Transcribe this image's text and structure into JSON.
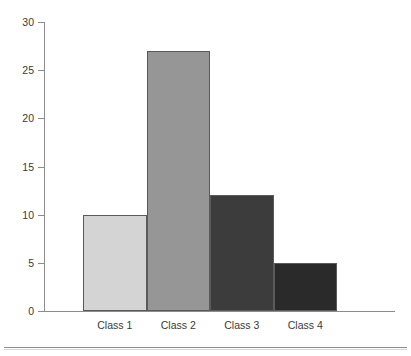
{
  "chart_data": {
    "type": "bar",
    "title": "",
    "subtitle": "",
    "xlabel": "",
    "ylabel": "",
    "categories": [
      "Class 1",
      "Class 2",
      "Class 3",
      "Class 4"
    ],
    "values": [
      10,
      27,
      12,
      5
    ],
    "ylim": [
      0,
      30
    ],
    "ytick_values": [
      0,
      5,
      10,
      15,
      20,
      25,
      30
    ],
    "ytick_labels": [
      "0",
      "5",
      "10",
      "15",
      "20",
      "25",
      "30"
    ],
    "ytick_step": 5,
    "grid": false,
    "legend": null,
    "legend_position": "none",
    "bar_gap": 0,
    "annotations": [],
    "bar_colors": [
      "#d4d4d4",
      "#969696",
      "#3c3c3c",
      "#2a2a2a"
    ],
    "bar_border_color": "#5a5a5a",
    "axis_color": "#8c8c8c",
    "tick_label_color": "#3a3a3a",
    "background_color": "#ffffff",
    "series": [
      {
        "name": "Frequency",
        "values": [
          10,
          27,
          12,
          5
        ]
      }
    ],
    "points": [
      {
        "category": "Class 1",
        "value": 10,
        "color": "#d4d4d4"
      },
      {
        "category": "Class 2",
        "value": 27,
        "color": "#969696"
      },
      {
        "category": "Class 3",
        "value": 12,
        "color": "#3c3c3c"
      },
      {
        "category": "Class 4",
        "value": 5,
        "color": "#2a2a2a"
      }
    ]
  },
  "footer": {
    "divider": true
  }
}
